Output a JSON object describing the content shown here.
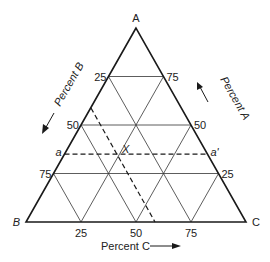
{
  "vertices": {
    "A": "A",
    "B": "B",
    "C": "C"
  },
  "axis_labels": {
    "percent_a": "Percent A",
    "percent_b": "Percent B",
    "percent_c": "Percent C"
  },
  "ticks": {
    "left_edge": [
      "25",
      "50",
      "75"
    ],
    "right_edge": [
      "75",
      "50",
      "25"
    ],
    "bottom_edge": [
      "25",
      "50",
      "75"
    ]
  },
  "grid_fractions": [
    0.25,
    0.5,
    0.75
  ],
  "point": {
    "label": "X",
    "percent_a": 35,
    "percent_c": 60
  },
  "constant_a_line": {
    "start_label": "a",
    "end_label": "a'",
    "percent_a": 35
  },
  "constant_c_line": {
    "percent_c": 60
  },
  "colors": {
    "ink": "#1a1a1a",
    "background": "#ffffff"
  }
}
